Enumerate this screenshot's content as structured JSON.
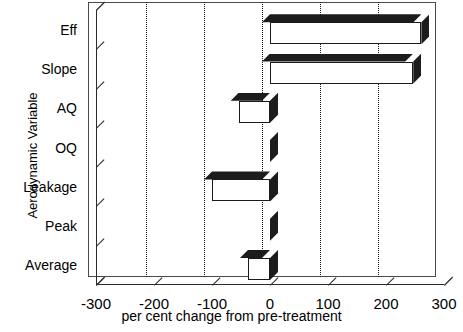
{
  "chart_data": {
    "type": "bar",
    "orientation": "horizontal",
    "title": "",
    "xlabel": "per cent change from pre-treatment",
    "ylabel": "Aerodynamic Variable",
    "categories": [
      "Eff",
      "Slope",
      "AQ",
      "OQ",
      "Leakage",
      "Peak",
      "Average"
    ],
    "values": [
      261,
      247,
      -54,
      0,
      -100,
      0,
      -38
    ],
    "xlim": [
      -300,
      300
    ],
    "xticks": [
      -300,
      -200,
      -100,
      0,
      100,
      200,
      300
    ],
    "xticklabels": [
      "-300",
      "-200",
      "-100",
      "0",
      "100",
      "200",
      "300"
    ],
    "grid": "vertical-dotted",
    "legend": "none",
    "style": "3d-bar",
    "colors": {
      "bar_face": "#ffffff",
      "bar_shade": "#1c1c1c",
      "axis": "#2a2a2a",
      "grid": "#111111",
      "background": "#ffffff"
    }
  }
}
